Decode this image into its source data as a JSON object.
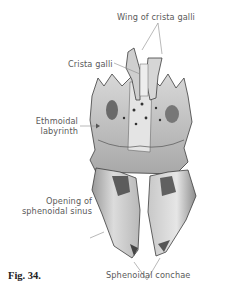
{
  "figure": {
    "caption": "Fig. 34.",
    "labels": {
      "wing_of_crista_galli": "Wing of crista galli",
      "crista_galli": "Crista galli",
      "ethmoidal_labyrinth_line1": "Ethmoidal",
      "ethmoidal_labyrinth_line2": "labyrinth",
      "opening_line1": "Opening of",
      "opening_line2": "sphenoidal sinus",
      "sphenoidal_conchae": "Sphenoidal conchae"
    },
    "colors": {
      "bone_light": "#e9e9e9",
      "bone_mid": "#bdbdbd",
      "bone_dark": "#6e6e6e",
      "outline": "#3c3c3c",
      "leader_line": "#8a8a8a",
      "label_text": "#5a5a5a"
    }
  }
}
